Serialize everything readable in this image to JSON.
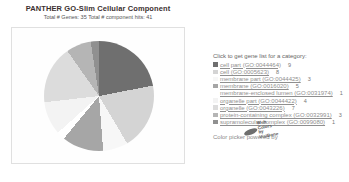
{
  "header": {
    "title": "PANTHER GO-Slim Cellular Component",
    "subtitle": "Total # Genes: 35   Total # component hits: 41"
  },
  "legend": {
    "heading": "Click to get gene list for a category:",
    "items": [
      {
        "label": "cell part (GO:0044464)",
        "count": "9",
        "color": "#6f6f6f"
      },
      {
        "label": "cell (GO:0005623)",
        "count": "8",
        "color": "#d4d4d4"
      },
      {
        "label": "membrane part (GO:0044425)",
        "count": "3",
        "color": "#f7f7f7"
      },
      {
        "label": "membrane (GO:0016020)",
        "count": "5",
        "color": "#a6a6a6"
      },
      {
        "label": "membrane-enclosed lumen (GO:0031974)",
        "count": "1",
        "color": "#ffffff"
      },
      {
        "label": "organelle part (GO:0044422)",
        "count": "4",
        "color": "#f3f3f3"
      },
      {
        "label": "organelle (GO:0043226)",
        "count": "7",
        "color": "#dcdcdc"
      },
      {
        "label": "protein-containing complex (GO:0032991)",
        "count": "3",
        "color": "#b5b5b5"
      },
      {
        "label": "supramolecular complex (GO:0099080)",
        "count": "1",
        "color": "#909090"
      }
    ]
  },
  "footer": {
    "powered_by": "Color picker powered by",
    "logo_lines": [
      "Web",
      "Colors by",
      "VisiBone"
    ]
  },
  "chart_data": {
    "type": "pie",
    "title": "PANTHER GO-Slim Cellular Component",
    "total_genes": 35,
    "total_component_hits": 41,
    "categories": [
      "cell part (GO:0044464)",
      "cell (GO:0005623)",
      "membrane part (GO:0044425)",
      "membrane (GO:0016020)",
      "membrane-enclosed lumen (GO:0031974)",
      "organelle part (GO:0044422)",
      "organelle (GO:0043226)",
      "protein-containing complex (GO:0032991)",
      "supramolecular complex (GO:0099080)"
    ],
    "values": [
      9,
      8,
      3,
      5,
      1,
      4,
      7,
      3,
      1
    ],
    "colors": [
      "#6f6f6f",
      "#d4d4d4",
      "#f7f7f7",
      "#a6a6a6",
      "#ffffff",
      "#f3f3f3",
      "#dcdcdc",
      "#b5b5b5",
      "#909090"
    ],
    "legend_position": "right",
    "start_angle_deg": 0,
    "direction": "clockwise"
  }
}
